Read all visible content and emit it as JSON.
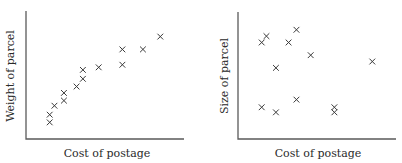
{
  "chart_data": [
    {
      "type": "scatter",
      "title": "",
      "xlabel": "Cost of postage",
      "ylabel": "Weight of parcel",
      "xlim": [
        0,
        10
      ],
      "ylim": [
        0,
        10
      ],
      "grid": false,
      "ticks": false,
      "marker": "x",
      "points": [
        {
          "x": 1.5,
          "y": 1.3
        },
        {
          "x": 1.5,
          "y": 1.9
        },
        {
          "x": 1.8,
          "y": 2.6
        },
        {
          "x": 2.4,
          "y": 3.0
        },
        {
          "x": 2.4,
          "y": 3.6
        },
        {
          "x": 3.2,
          "y": 4.1
        },
        {
          "x": 3.6,
          "y": 4.7
        },
        {
          "x": 3.6,
          "y": 5.4
        },
        {
          "x": 4.6,
          "y": 5.6
        },
        {
          "x": 6.1,
          "y": 5.8
        },
        {
          "x": 6.1,
          "y": 7.0
        },
        {
          "x": 7.4,
          "y": 7.0
        },
        {
          "x": 8.5,
          "y": 8.0
        }
      ]
    },
    {
      "type": "scatter",
      "title": "",
      "xlabel": "Cost of postage",
      "ylabel": "Size of parcel",
      "xlim": [
        0,
        10
      ],
      "ylim": [
        0,
        10
      ],
      "grid": false,
      "ticks": false,
      "marker": "x",
      "points": [
        {
          "x": 1.5,
          "y": 7.6
        },
        {
          "x": 1.8,
          "y": 8.1
        },
        {
          "x": 3.7,
          "y": 8.6
        },
        {
          "x": 3.2,
          "y": 7.6
        },
        {
          "x": 4.6,
          "y": 6.6
        },
        {
          "x": 2.4,
          "y": 5.6
        },
        {
          "x": 8.5,
          "y": 6.1
        },
        {
          "x": 1.5,
          "y": 2.5
        },
        {
          "x": 2.4,
          "y": 2.1
        },
        {
          "x": 3.7,
          "y": 3.1
        },
        {
          "x": 6.1,
          "y": 2.5
        },
        {
          "x": 6.1,
          "y": 2.1
        }
      ]
    }
  ]
}
